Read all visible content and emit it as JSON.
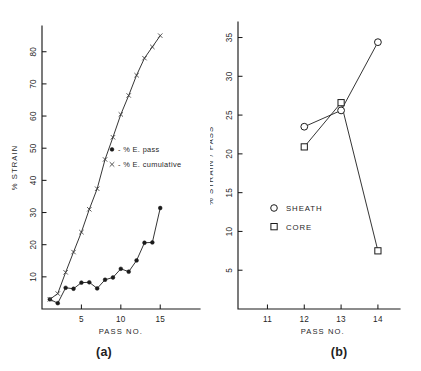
{
  "figure": {
    "background_color": "#ffffff",
    "ink_color": "#1b1b1b"
  },
  "panel_a": {
    "label": "(a)",
    "xlabel": "PASS  NO.",
    "ylabel": "%  STRAIN",
    "xticks": [
      "5",
      "10",
      "15"
    ],
    "yticks": [
      "10",
      "20",
      "30",
      "40",
      "50",
      "60",
      "70",
      "80"
    ],
    "legend": [
      {
        "marker": "filled-circle",
        "text": "- % E. pass"
      },
      {
        "marker": "cross",
        "text": "- % E. cumulative"
      }
    ]
  },
  "panel_b": {
    "label": "(b)",
    "xlabel": "PASS   NO.",
    "ylabel": "%  STRAIN / PASS",
    "xticks": [
      "11",
      "12",
      "13",
      "14"
    ],
    "yticks": [
      "5",
      "10",
      "15",
      "20",
      "25",
      "30",
      "35"
    ],
    "legend": [
      {
        "marker": "open-circle",
        "text": "SHEATH"
      },
      {
        "marker": "open-square",
        "text": "CORE"
      }
    ]
  },
  "chart_data": [
    {
      "type": "line",
      "panel": "(a)",
      "title": "",
      "xlabel": "PASS  NO.",
      "ylabel": "%  STRAIN",
      "xlim": [
        0,
        17
      ],
      "ylim": [
        0,
        88
      ],
      "xticks": [
        5,
        10,
        15
      ],
      "yticks": [
        10,
        20,
        30,
        40,
        50,
        60,
        70,
        80
      ],
      "grid": false,
      "legend_position": "center-right",
      "x": [
        1,
        2,
        3,
        4,
        5,
        6,
        7,
        8,
        9,
        10,
        11,
        12,
        13,
        14,
        15
      ],
      "series": [
        {
          "name": "% E. pass",
          "marker": "filled-circle",
          "values": [
            3.0,
            1.8,
            6.6,
            6.3,
            8.2,
            8.3,
            6.4,
            9.1,
            9.8,
            12.5,
            11.6,
            15.1,
            20.6,
            20.7,
            31.4
          ]
        },
        {
          "name": "% E. cumulative",
          "marker": "cross",
          "values": [
            3.0,
            4.8,
            11.4,
            17.7,
            23.9,
            31.0,
            37.4,
            46.5,
            53.4,
            60.5,
            66.4,
            72.7,
            78.0,
            81.5,
            85.0
          ]
        }
      ]
    },
    {
      "type": "line",
      "panel": "(b)",
      "title": "",
      "xlabel": "PASS   NO.",
      "ylabel": "%  STRAIN / PASS",
      "xlim": [
        10.2,
        14.6
      ],
      "ylim": [
        0,
        37
      ],
      "xticks": [
        11,
        12,
        13,
        14
      ],
      "yticks": [
        5,
        10,
        15,
        20,
        25,
        30,
        35
      ],
      "grid": false,
      "legend_position": "center-left",
      "x": [
        12,
        13,
        14
      ],
      "series": [
        {
          "name": "SHEATH",
          "marker": "open-circle",
          "values": [
            23.5,
            25.6,
            34.4
          ]
        },
        {
          "name": "CORE",
          "marker": "open-square",
          "values": [
            20.9,
            26.6,
            7.5
          ]
        }
      ]
    }
  ]
}
